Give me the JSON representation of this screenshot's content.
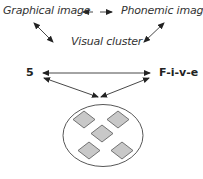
{
  "diagram": {
    "nodes": {
      "graphical_image": "Graphical image",
      "phonemic_image": "Phonemic image",
      "visual_cluster": "Visual cluster",
      "digit": "5",
      "spelled": "F-i-v-e"
    },
    "edges": [
      {
        "from": "graphical_image",
        "to": "phonemic_image",
        "type": "bidirectional-dashed"
      },
      {
        "from": "graphical_image",
        "to": "visual_cluster",
        "type": "bidirectional"
      },
      {
        "from": "phonemic_image",
        "to": "visual_cluster",
        "type": "bidirectional"
      },
      {
        "from": "digit",
        "to": "spelled",
        "type": "bidirectional"
      },
      {
        "from": "digit",
        "to": "dot_cluster",
        "type": "arrow"
      },
      {
        "from": "spelled",
        "to": "dot_cluster",
        "type": "arrow"
      }
    ],
    "dot_cluster": {
      "shape": "ellipse",
      "item_count": 5,
      "item_shape": "diamond",
      "item_fill": "#c8c8c8",
      "item_stroke": "#555555"
    },
    "colors": {
      "line": "#333333",
      "text": "#333333"
    }
  }
}
